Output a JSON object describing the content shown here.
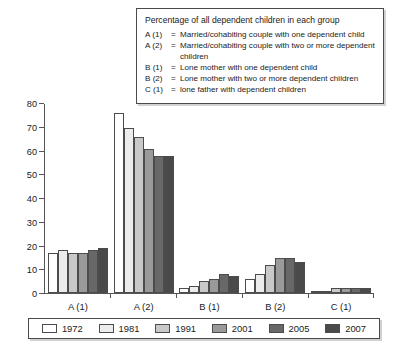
{
  "keybox": {
    "title": "Percentage of all dependent children in each group",
    "rows": [
      {
        "code": "A (1)",
        "eq": "=",
        "text": "Married/cohabiting couple with one dependent child"
      },
      {
        "code": "A (2)",
        "eq": "=",
        "text": "Married/cohabiting couple with two or more dependent children"
      },
      {
        "code": "B (1)",
        "eq": "=",
        "text": "Lone mother with one dependent child"
      },
      {
        "code": "B (2)",
        "eq": "=",
        "text": "Lone mother with two or more dependent children"
      },
      {
        "code": "C (1)",
        "eq": "=",
        "text": "lone father with dependent children"
      }
    ]
  },
  "chart_data": {
    "type": "bar",
    "title": "Percentage of all dependent children in each group",
    "xlabel": "",
    "ylabel": "",
    "ylim": [
      0,
      80
    ],
    "yticks": [
      0,
      10,
      20,
      30,
      40,
      50,
      60,
      70,
      80
    ],
    "grid": false,
    "legend_position": "bottom",
    "categories": [
      "A (1)",
      "A (2)",
      "B (1)",
      "B (2)",
      "C (1)"
    ],
    "series": [
      {
        "name": "1972",
        "color": "#ffffff",
        "values": [
          17,
          76,
          2,
          6,
          1
        ]
      },
      {
        "name": "1981",
        "color": "#ececec",
        "values": [
          18,
          70,
          3,
          8,
          1
        ]
      },
      {
        "name": "1991",
        "color": "#c9c9c9",
        "values": [
          17,
          66,
          5,
          12,
          2
        ]
      },
      {
        "name": "2001",
        "color": "#9a9a9a",
        "values": [
          17,
          61,
          6,
          15,
          2
        ]
      },
      {
        "name": "2005",
        "color": "#686868",
        "values": [
          18,
          58,
          8,
          15,
          2
        ]
      },
      {
        "name": "2007",
        "color": "#4a4a4a",
        "values": [
          19,
          58,
          7,
          13,
          2
        ]
      }
    ]
  }
}
